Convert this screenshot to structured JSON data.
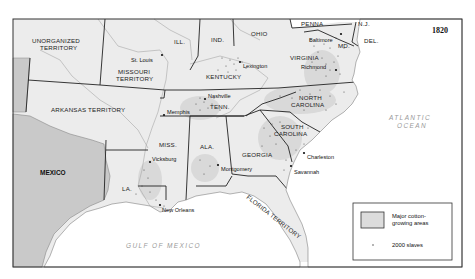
{
  "map": {
    "year": "1820",
    "colors": {
      "land": "#ececec",
      "cotton_area": "#d9d9d9",
      "mexico": "#c9c9c9",
      "water": "#ffffff",
      "border": "#222222",
      "river": "#a8a8a8",
      "dot": "#333333"
    },
    "territories": [
      {
        "id": "unorganized",
        "label_line1": "UNORGANIZED",
        "label_line2": "TERRITORY"
      },
      {
        "id": "missouri",
        "label_line1": "MISSOURI",
        "label_line2": "TERRITORY"
      },
      {
        "id": "arkansas",
        "label": "ARKANSAS TERRITORY"
      },
      {
        "id": "florida",
        "label": "FLORIDA TERRITORY"
      }
    ],
    "states": {
      "ill": "ILL.",
      "ind": "IND.",
      "ohio": "OHIO",
      "penna": "PENNA",
      "nj": "N.J.",
      "del": "DEL.",
      "md": "MD.",
      "virginia": "VIRGINIA",
      "kentucky": "KENTUCKY",
      "tenn": "TENN.",
      "nc_line1": "NORTH",
      "nc_line2": "CAROLINA",
      "sc_line1": "SOUTH",
      "sc_line2": "CAROLINA",
      "georgia": "GEORGIA",
      "ala": "ALA.",
      "miss": "MISS.",
      "la": "LA."
    },
    "countries": {
      "mexico": "MEXICO"
    },
    "water_bodies": {
      "atlantic_line1": "ATLANTIC",
      "atlantic_line2": "OCEAN",
      "gulf": "GULF OF MEXICO"
    },
    "cities": {
      "st_louis": "St. Louis",
      "lexington": "Lexington",
      "baltimore": "Baltimore",
      "richmond": "Richmond",
      "nashville": "Nashville",
      "memphis": "Memphis",
      "vicksburg": "Vicksburg",
      "montgomery": "Montgomery",
      "new_orleans": "New Orleans",
      "charleston": "Charleston",
      "savannah": "Savannah"
    }
  },
  "legend": {
    "cotton_line1": "Major cotton-",
    "cotton_line2": "growing areas",
    "dot_label": "2000 slaves"
  }
}
